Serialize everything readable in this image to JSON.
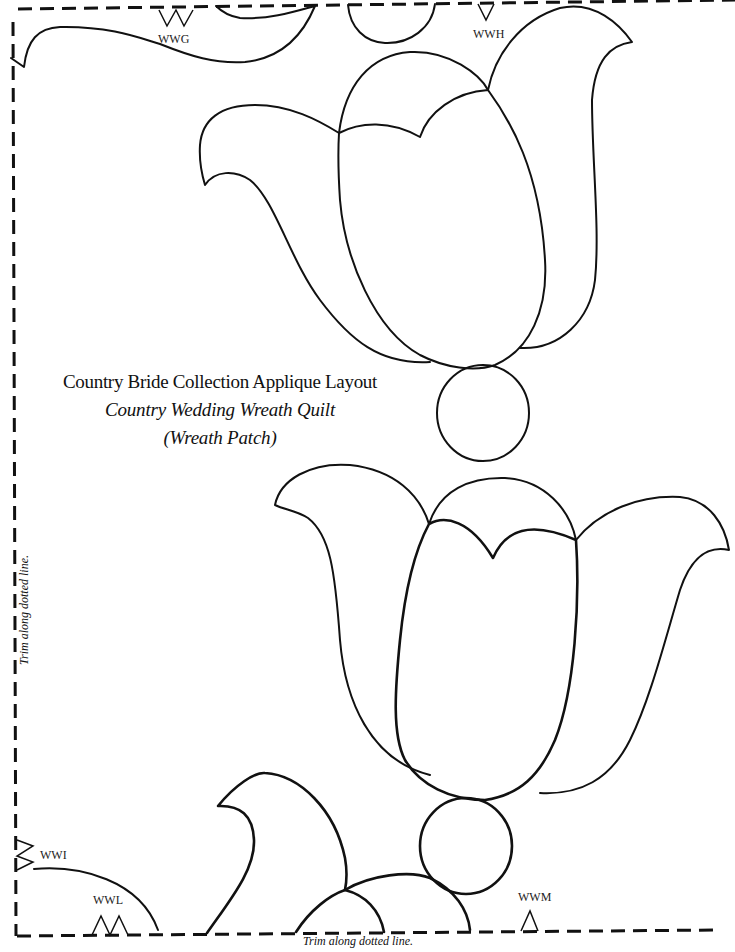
{
  "document": {
    "type": "applique-pattern-layout",
    "title": {
      "line1": "Country Bride Collection Applique Layout",
      "line2": "Country Wedding Wreath Quilt",
      "line3": "(Wreath Patch)"
    },
    "trim_instructions": {
      "bottom": "Trim along dotted line.",
      "side": "Trim along dotted line."
    },
    "placement_marks": [
      {
        "id": "WWG",
        "label": "WWG",
        "position": "top",
        "notch": "double-down"
      },
      {
        "id": "WWH",
        "label": "WWH",
        "position": "top",
        "notch": "single-down"
      },
      {
        "id": "WWI",
        "label": "WWI",
        "position": "left",
        "notch": "double-right"
      },
      {
        "id": "WWL",
        "label": "WWL",
        "position": "bottom",
        "notch": "double-up"
      },
      {
        "id": "WWM",
        "label": "WWM",
        "position": "bottom",
        "notch": "single-up"
      }
    ],
    "shapes": [
      {
        "name": "top-left-leaf",
        "kind": "leaf"
      },
      {
        "name": "top-partial-circle",
        "kind": "circle"
      },
      {
        "name": "upper-tulip",
        "kind": "tulip",
        "parts": [
          "left-petal",
          "center-bud",
          "front-petal",
          "right-petal"
        ]
      },
      {
        "name": "upper-circle",
        "kind": "circle"
      },
      {
        "name": "lower-tulip",
        "kind": "tulip",
        "parts": [
          "left-petal",
          "center-bud",
          "front-petal",
          "right-petal"
        ]
      },
      {
        "name": "lower-circle",
        "kind": "circle"
      },
      {
        "name": "bottom-left-leaf",
        "kind": "leaf"
      },
      {
        "name": "bottom-corner-arc",
        "kind": "arc"
      },
      {
        "name": "bottom-tulip-partial",
        "kind": "tulip-partial"
      }
    ],
    "colors": {
      "ink": "#111111",
      "paper": "#ffffff"
    }
  }
}
